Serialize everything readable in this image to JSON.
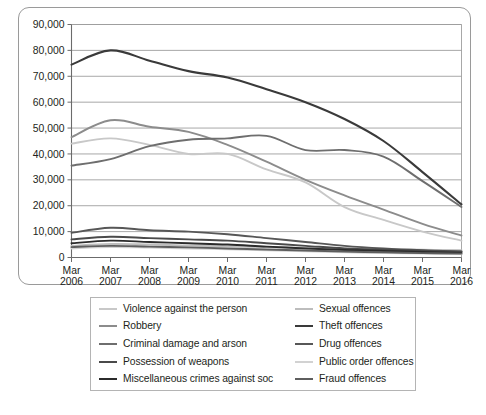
{
  "chart_data": {
    "type": "line",
    "title": "",
    "subtitle": "",
    "xlabel": "",
    "ylabel": "",
    "grid": true,
    "legend_position": "bottom",
    "ylim": [
      0,
      90000
    ],
    "ytick_step": 10000,
    "ytick_labels": [
      "0",
      "10,000",
      "20,000",
      "30,000",
      "40,000",
      "50,000",
      "60,000",
      "70,000",
      "80,000",
      "90,000"
    ],
    "ytick_values": [
      0,
      10000,
      20000,
      30000,
      40000,
      50000,
      60000,
      70000,
      80000,
      90000
    ],
    "categories": [
      "Mar 2006",
      "Mar 2007",
      "Mar 2008",
      "Mar 2009",
      "Mar 2010",
      "Mar 2011",
      "Mar 2012",
      "Mar 2013",
      "Mar 2014",
      "Mar 2015",
      "Mar 2016"
    ],
    "xtick_lines": [
      [
        "Mar",
        "2006"
      ],
      [
        "Mar",
        "2007"
      ],
      [
        "Mar",
        "2008"
      ],
      [
        "Mar",
        "2009"
      ],
      [
        "Mar",
        "2010"
      ],
      [
        "Mar",
        "2011"
      ],
      [
        "Mar",
        "2012"
      ],
      [
        "Mar",
        "2013"
      ],
      [
        "Mar",
        "2014"
      ],
      [
        "Mar",
        "2015"
      ],
      [
        "Mar",
        "2016"
      ]
    ],
    "series": [
      {
        "name": "Violence against the person",
        "color": "#c8c8c8",
        "width": 1.9,
        "values": [
          44000,
          46000,
          43500,
          40000,
          40000,
          34000,
          29000,
          19500,
          14500,
          10000,
          6500
        ]
      },
      {
        "name": "Sexual offences",
        "color": "#bdbdbd",
        "width": 1.9,
        "values": [
          4500,
          5200,
          5000,
          4600,
          4300,
          4000,
          3700,
          3400,
          3200,
          3000,
          2800
        ]
      },
      {
        "name": "Robbery",
        "color": "#8c8c8c",
        "width": 1.9,
        "values": [
          46500,
          53000,
          50500,
          48500,
          43500,
          37000,
          30000,
          24000,
          18500,
          13000,
          8500
        ]
      },
      {
        "name": "Theft offences",
        "color": "#3a3a3a",
        "width": 2.1,
        "values": [
          74500,
          80000,
          76000,
          72000,
          69500,
          65000,
          60000,
          53500,
          45000,
          33000,
          20500
        ]
      },
      {
        "name": "Criminal damage and arson",
        "color": "#6e6e6e",
        "width": 1.9,
        "values": [
          35500,
          38000,
          43000,
          45500,
          46000,
          47000,
          41500,
          41500,
          39000,
          29500,
          19500
        ]
      },
      {
        "name": "Drug offences",
        "color": "#575757",
        "width": 1.9,
        "values": [
          9500,
          11500,
          10500,
          10000,
          9000,
          7500,
          6000,
          4500,
          3500,
          2800,
          2300
        ]
      },
      {
        "name": "Possession of weapons",
        "color": "#4a4a4a",
        "width": 1.9,
        "values": [
          7000,
          8000,
          7500,
          7000,
          6500,
          5500,
          4500,
          3500,
          3000,
          2600,
          2200
        ]
      },
      {
        "name": "Public order offences",
        "color": "#d2d2d2",
        "width": 1.9,
        "values": [
          3500,
          4000,
          3800,
          3500,
          3200,
          2800,
          2400,
          2000,
          1700,
          1500,
          1300
        ]
      },
      {
        "name": "Miscellaneous crimes against soc",
        "color": "#2b2b2b",
        "width": 1.9,
        "values": [
          5500,
          6500,
          6000,
          5500,
          5000,
          4200,
          3500,
          2900,
          2500,
          2100,
          1800
        ]
      },
      {
        "name": "Fraud offences",
        "color": "#5e5e5e",
        "width": 1.9,
        "values": [
          4000,
          4500,
          4200,
          3900,
          3500,
          3100,
          2700,
          2300,
          2000,
          1700,
          1500
        ]
      }
    ]
  },
  "legend": {
    "entries": [
      {
        "label": "Violence against the person",
        "color": "#c8c8c8"
      },
      {
        "label": "Sexual offences",
        "color": "#bdbdbd"
      },
      {
        "label": "Robbery",
        "color": "#8c8c8c"
      },
      {
        "label": "Theft offences",
        "color": "#3a3a3a"
      },
      {
        "label": "Criminal damage and arson",
        "color": "#6e6e6e"
      },
      {
        "label": "Drug offences",
        "color": "#575757"
      },
      {
        "label": "Possession of weapons",
        "color": "#4a4a4a"
      },
      {
        "label": "Public order offences",
        "color": "#d2d2d2"
      },
      {
        "label": "Miscellaneous crimes against soc",
        "color": "#2b2b2b"
      },
      {
        "label": "Fraud offences",
        "color": "#5e5e5e"
      }
    ]
  },
  "style": {
    "grid_color": "#9e9e9e",
    "axis_color": "#6b6b6b",
    "frame_color": "#9a9a9a",
    "text_color": "#231f20",
    "background": "#ffffff"
  }
}
